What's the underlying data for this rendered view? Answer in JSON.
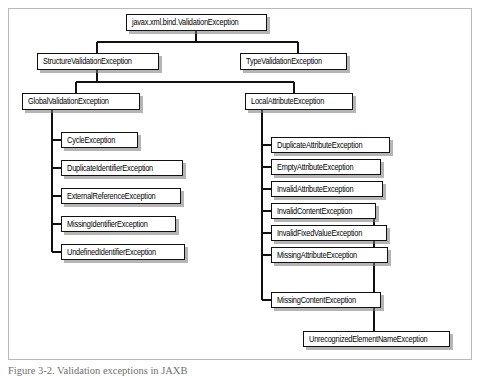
{
  "figure": {
    "caption": "Figure 3-2. Validation exceptions in JAXB",
    "frame_color": "#b9b9b9",
    "box_border_color": "#111111",
    "box_fill_color": "#ffffff",
    "shadow_color": "#787878",
    "connector_color": "#111111",
    "background_color": "#ffffff"
  },
  "diagram": {
    "type": "class-hierarchy-tree",
    "root": {
      "id": "root",
      "label": "javax.xml.bind.ValidationException"
    },
    "level2": [
      {
        "id": "structure",
        "label": "StructureValidationException"
      },
      {
        "id": "type",
        "label": "TypeValidationException"
      }
    ],
    "level3": [
      {
        "id": "global",
        "label": "GlobalValidationException"
      },
      {
        "id": "local",
        "label": "LocalAttributeException"
      }
    ],
    "global_children": [
      {
        "id": "cycle",
        "label": "CycleException"
      },
      {
        "id": "dupid",
        "label": "DuplicateIdentifierException"
      },
      {
        "id": "extref",
        "label": "ExternalReferenceException"
      },
      {
        "id": "missid",
        "label": "MissingIdentifierException"
      },
      {
        "id": "undefid",
        "label": "UndefinedIdentifierException"
      }
    ],
    "local_children": [
      {
        "id": "dupattr",
        "label": "DuplicateAttributeException"
      },
      {
        "id": "emptyattr",
        "label": "EmptyAttributeException"
      },
      {
        "id": "invattr",
        "label": "InvalidAttributeException"
      },
      {
        "id": "invcontent",
        "label": "InvalidContentException"
      },
      {
        "id": "invfixed",
        "label": "InvalidFixedValueException"
      },
      {
        "id": "missattr",
        "label": "MissingAttributeException"
      },
      {
        "id": "misscontent",
        "label": "MissingContentException"
      }
    ],
    "invalidcontent_children": [
      {
        "id": "unrecog",
        "label": "UnrecognizedElementNameException"
      }
    ]
  }
}
